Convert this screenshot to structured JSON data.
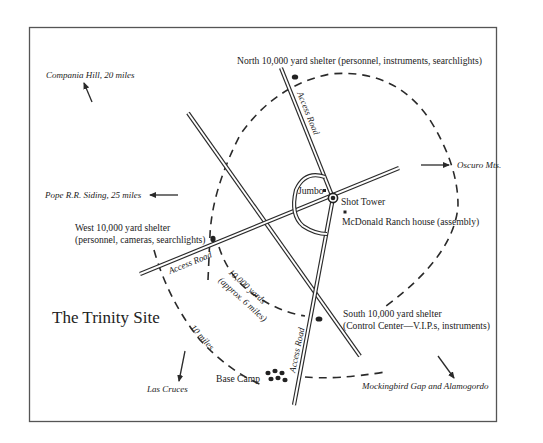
{
  "title": "The Trinity Site",
  "labels": {
    "north_shelter": "North 10,000 yard shelter (personnel, instruments, searchlights)",
    "west_shelter_line1": "West 10,000 yard shelter",
    "west_shelter_line2": "(personnel, cameras, searchlights)",
    "south_shelter_line1": "South 10,000 yard shelter",
    "south_shelter_line2": "(Control Center—V.I.P.s, instruments)",
    "shot_tower": "Shot Tower",
    "jumbo": "Jumbo",
    "mcdonald_ranch": "McDonald Ranch house (assembly)",
    "base_camp": "Base Camp",
    "access_road_north": "Access Road",
    "access_road_west": "Access Road",
    "access_road_south": "Access Road",
    "inner_ring_line1": "10,000 yards",
    "inner_ring_line2": "(approx. 6 miles)",
    "outer_ring": "10 miles"
  },
  "directions": {
    "compania_hill": "Compania Hill, 20 miles",
    "pope_siding": "Pope R.R. Siding, 25 miles",
    "oscuro": "Oscuro Mts.",
    "las_cruces": "Las Cruces",
    "mockingbird": "Mockingbird Gap and Alamogordo"
  }
}
